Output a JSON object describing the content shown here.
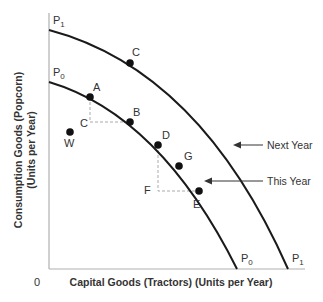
{
  "diagram": {
    "type": "production_possibilities_frontier",
    "origin_label": "0",
    "x_axis_label": "Capital Goods (Tractors) (Units per Year)",
    "y_axis_label_line1": "Consumption Goods (Popcorn)",
    "y_axis_label_line2": "(Units per Year)",
    "curves": [
      {
        "name": "P0",
        "base": "P",
        "sub": "0",
        "annotation": "This Year"
      },
      {
        "name": "P1",
        "base": "P",
        "sub": "1",
        "annotation": "Next Year"
      }
    ],
    "points": {
      "C_on_P1": "C",
      "A": "A",
      "B": "B",
      "C_inside": "C",
      "W": "W",
      "D": "D",
      "G": "G",
      "F": "F",
      "E": "E"
    },
    "colors": {
      "curve": "#1a1a1a",
      "axis": "#aaaaaa",
      "dashed": "#aaaaaa",
      "text": "#333333"
    }
  }
}
